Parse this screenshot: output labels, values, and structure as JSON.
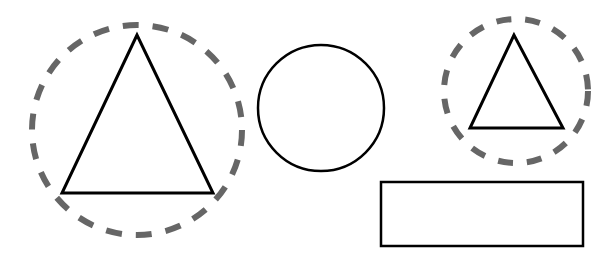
{
  "canvas": {
    "width": 606,
    "height": 261,
    "background": "#ffffff"
  },
  "colors": {
    "stroke": "#000000",
    "dashed": "#666666"
  },
  "shapes": {
    "large_dashed_circle": {
      "cx": 137,
      "cy": 130,
      "r": 105
    },
    "large_triangle": {
      "points": "137,35 62,193 213,193"
    },
    "solid_circle": {
      "cx": 321,
      "cy": 108,
      "r": 63
    },
    "small_dashed_circle": {
      "cx": 516,
      "cy": 91,
      "r": 72
    },
    "small_triangle": {
      "points": "514,35 470,128 563,128"
    },
    "rectangle": {
      "x": 381,
      "y": 182,
      "width": 202,
      "height": 64
    }
  }
}
